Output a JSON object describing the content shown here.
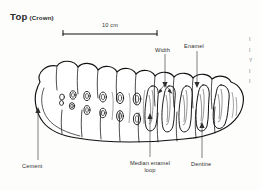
{
  "figure": {
    "title_main": "Top",
    "title_sub": "(Crown)",
    "background_color": "#fdfdfc",
    "ink_color": "#111111",
    "text_color": "#2e2e2e"
  },
  "scalebar": {
    "label": "10 cm",
    "length_px": 96
  },
  "labels": {
    "width": "Width",
    "enamel": "Enamel",
    "cement": "Cement",
    "median_enamel_line1": "Median enamel",
    "median_enamel_line2": "loop",
    "dentine": "Dentine"
  },
  "margin_text": {
    "lines": [
      "I",
      "I",
      "Y",
      "I",
      "I"
    ]
  },
  "diagram": {
    "view": "crown",
    "enamel_loop_count": 16
  }
}
